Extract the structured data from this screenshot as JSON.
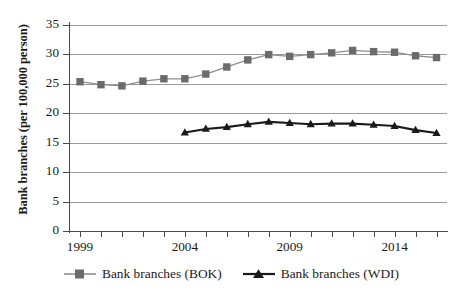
{
  "chart_data": {
    "type": "line",
    "title": "",
    "subtitle": "",
    "xlabel": "",
    "ylabel": "Bank branches (per 100,000 person)",
    "x": [
      1999,
      2000,
      2001,
      2002,
      2003,
      2004,
      2005,
      2006,
      2007,
      2008,
      2009,
      2010,
      2011,
      2012,
      2013,
      2014,
      2015,
      2016
    ],
    "xlim": [
      1998.5,
      2016.5
    ],
    "ylim": [
      0,
      35
    ],
    "yticks": [
      0,
      5,
      10,
      15,
      20,
      25,
      30,
      35
    ],
    "ytick_labels": [
      "0",
      "5",
      "10",
      "15",
      "20",
      "25",
      "30",
      "35"
    ],
    "xtick_labels": [
      "1999",
      "",
      "",
      "",
      "",
      "2004",
      "",
      "",
      "",
      "",
      "2009",
      "",
      "",
      "",
      "",
      "2014",
      "",
      ""
    ],
    "xtick_labels_shown": [
      "1999",
      "2004",
      "2009",
      "2014"
    ],
    "grid": true,
    "grid_axis": "y",
    "legend_position": "bottom",
    "series": [
      {
        "name": "Bank branches (BOK)",
        "marker": "square",
        "color": "#6b6b6b",
        "line_color": "#8f8f8f",
        "x": [
          1999,
          2000,
          2001,
          2002,
          2003,
          2004,
          2005,
          2006,
          2007,
          2008,
          2009,
          2010,
          2011,
          2012,
          2013,
          2014,
          2015,
          2016
        ],
        "values": [
          25.3,
          24.8,
          24.6,
          25.4,
          25.8,
          25.8,
          26.6,
          27.8,
          29.0,
          29.9,
          29.6,
          29.9,
          30.2,
          30.6,
          30.4,
          30.3,
          29.7,
          29.4
        ]
      },
      {
        "name": "Bank branches (WDI)",
        "marker": "triangle",
        "color": "#1a1a1a",
        "line_color": "#1a1a1a",
        "x": [
          2004,
          2005,
          2006,
          2007,
          2008,
          2009,
          2010,
          2011,
          2012,
          2013,
          2014,
          2015,
          2016
        ],
        "values": [
          16.7,
          17.3,
          17.6,
          18.1,
          18.5,
          18.3,
          18.1,
          18.2,
          18.2,
          18.0,
          17.8,
          17.1,
          16.6
        ]
      }
    ]
  },
  "legend": {
    "entries": [
      {
        "label": "Bank branches (BOK)"
      },
      {
        "label": "Bank branches (WDI)"
      }
    ]
  },
  "axes": {
    "y_title": "Bank branches (per 100,000 person)"
  }
}
